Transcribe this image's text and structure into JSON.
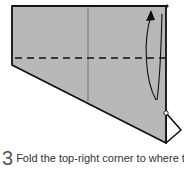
{
  "diagram": {
    "paper_color": "#b8b8b8",
    "line_color": "#111111",
    "elements": [
      "paper-shape",
      "center-crease",
      "horizontal-dashed-valley-fold",
      "fold-arrow",
      "reference-dot",
      "corner-dot",
      "small-flap"
    ]
  },
  "step": {
    "number": "3",
    "instruction": "Fold the top-right corner to where the"
  }
}
